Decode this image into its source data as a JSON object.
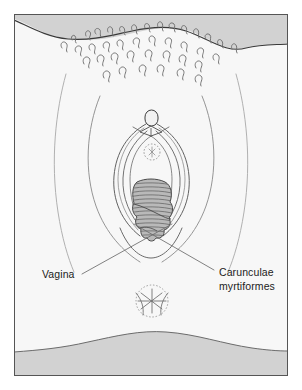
{
  "figure": {
    "kind": "anatomical-line-illustration",
    "canvas": {
      "width": 302,
      "height": 390
    },
    "frame": {
      "x": 14,
      "y": 14,
      "width": 274,
      "height": 362,
      "border_color": "#555555",
      "border_width": 1,
      "fill_color": "#f7f7f7"
    },
    "palette": {
      "paper": "#ffffff",
      "skin_field": "#f7f7f7",
      "shaded_band": "#d2d2d2",
      "outline": "#3a3a3a",
      "thin_line": "#9a9a9a",
      "hair": "#6f6f6f",
      "caruncula_fill": "#b9b9b9",
      "caruncula_hatch": "#5c5c5c",
      "label_text": "#1b1b1b",
      "leader_line": "#6b6b6b"
    }
  },
  "labels": [
    {
      "id": "vagina",
      "name": "Vagina",
      "lines": [
        "Vagina"
      ],
      "text_x": 42,
      "text_y": 278,
      "anchor": "start",
      "leader": {
        "x1": 82,
        "y1": 274,
        "x2": 172,
        "y2": 224
      }
    },
    {
      "id": "carunculae",
      "name": "Carunculae myrtiformes",
      "lines": [
        "Carunculae",
        "myrtiformes"
      ],
      "text_x": 219,
      "text_y": 276,
      "anchor": "start",
      "leader": {
        "x1": 214,
        "y1": 270,
        "x2": 134,
        "y2": 224
      }
    }
  ],
  "structures": [
    {
      "id": "mons-pubis",
      "name": "Mons pubis"
    },
    {
      "id": "pubic-hair",
      "name": "Pubic hair",
      "count": 34
    },
    {
      "id": "labia-majora",
      "name": "Labia majora"
    },
    {
      "id": "labia-minora",
      "name": "Labia minora"
    },
    {
      "id": "clitoral-hood",
      "name": "Clitoral hood and glans"
    },
    {
      "id": "urethral-meatus",
      "name": "External urethral orifice",
      "cx": 152,
      "cy": 152,
      "r": 8
    },
    {
      "id": "vaginal-introitus",
      "name": "Vaginal introitus"
    },
    {
      "id": "carunculae-mass",
      "name": "Carunculae myrtiformes"
    },
    {
      "id": "anus",
      "name": "Anus",
      "cx": 152,
      "cy": 301,
      "r": 16
    },
    {
      "id": "inner-thigh-left",
      "name": "Left inner thigh crease"
    },
    {
      "id": "inner-thigh-right",
      "name": "Right inner thigh crease"
    },
    {
      "id": "upper-shaded-band",
      "name": "Upper shaded band (abdomen)"
    },
    {
      "id": "lower-shaded-band",
      "name": "Lower shaded band (buttocks)"
    }
  ]
}
